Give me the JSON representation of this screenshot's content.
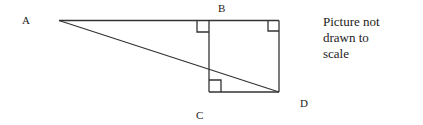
{
  "diagram": {
    "labels": {
      "A": "A",
      "B": "B",
      "C": "C",
      "D": "D"
    },
    "note": [
      "Picture not",
      "drawn to",
      "scale"
    ],
    "elements": [
      "triangle-ABD",
      "square-B-C-D",
      "right-angle-markers"
    ]
  }
}
